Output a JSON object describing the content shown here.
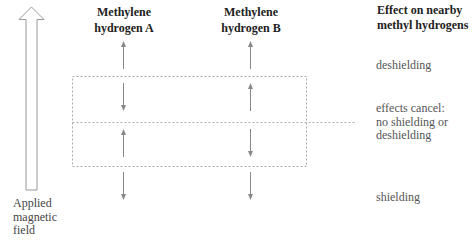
{
  "field_arrow": {
    "label_lines": [
      "Applied",
      "magnetic",
      "field"
    ],
    "direction": "up"
  },
  "columns": [
    {
      "id": "A",
      "title_lines": [
        "Methylene",
        "hydrogen A"
      ],
      "arrows": [
        {
          "region": "above",
          "direction": "up"
        },
        {
          "region": "box-upper",
          "direction": "down"
        },
        {
          "region": "box-lower",
          "direction": "up"
        },
        {
          "region": "below",
          "direction": "down"
        }
      ]
    },
    {
      "id": "B",
      "title_lines": [
        "Methylene",
        "hydrogen B"
      ],
      "arrows": [
        {
          "region": "above",
          "direction": "up"
        },
        {
          "region": "box-upper",
          "direction": "up"
        },
        {
          "region": "box-lower",
          "direction": "down"
        },
        {
          "region": "below",
          "direction": "down"
        }
      ]
    }
  ],
  "effect_column": {
    "title_lines": [
      "Effect on nearby",
      "methyl hydrogens"
    ],
    "effects": [
      {
        "region": "above",
        "lines": [
          "deshielding"
        ]
      },
      {
        "region": "middle",
        "lines": [
          "effects cancel:",
          "no shielding or",
          "deshielding"
        ]
      },
      {
        "region": "below",
        "lines": [
          "shielding"
        ]
      }
    ]
  },
  "colors": {
    "title_text": "#222222",
    "label_text": "#555555",
    "arrow": "#888888",
    "field_arrow_stroke": "#999999",
    "dotted_line": "#aaaaaa"
  }
}
